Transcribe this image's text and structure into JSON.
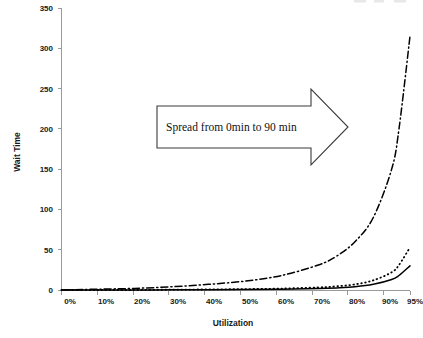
{
  "chart_data": {
    "type": "line",
    "title": "",
    "subtitle": "",
    "xlabel": "Utilization",
    "ylabel": "Wait Time",
    "xlim": [
      0,
      95
    ],
    "ylim": [
      0,
      350
    ],
    "grid": false,
    "legend_position": "top-right-cropped",
    "x_tick_labels": [
      "0%",
      "10%",
      "20%",
      "30%",
      "40%",
      "50%",
      "60%",
      "70%",
      "80%",
      "90%",
      "95%"
    ],
    "x_tick_values": [
      0,
      10,
      20,
      30,
      40,
      50,
      60,
      70,
      80,
      90,
      95
    ],
    "y_tick_labels": [
      "0",
      "50",
      "100",
      "150",
      "200",
      "250",
      "300",
      "350"
    ],
    "y_tick_values": [
      0,
      50,
      100,
      150,
      200,
      250,
      300,
      350
    ],
    "x": [
      0,
      10,
      20,
      30,
      40,
      50,
      60,
      70,
      75,
      80,
      85,
      90,
      92,
      95
    ],
    "series": [
      {
        "name": "high-variability",
        "style": "dash-dot",
        "values": [
          0,
          1,
          2,
          4,
          7,
          11,
          18,
          31,
          42,
          60,
          90,
          150,
          200,
          315
        ]
      },
      {
        "name": "medium-variability",
        "style": "dotted",
        "values": [
          0,
          0,
          0,
          0.4,
          0.7,
          1.1,
          1.8,
          3.2,
          4.6,
          7,
          12,
          22,
          31,
          53
        ]
      },
      {
        "name": "low-variability",
        "style": "solid",
        "values": [
          0,
          0,
          0,
          0.2,
          0.4,
          0.6,
          1,
          1.8,
          2.6,
          4,
          7,
          13,
          18,
          30
        ]
      }
    ],
    "annotations": [
      {
        "name": "spread-arrow",
        "shape": "right-arrow",
        "text": "Spread from 0min to 90 min",
        "x_start": 32,
        "x_end": 88,
        "y_center": 205
      }
    ]
  }
}
